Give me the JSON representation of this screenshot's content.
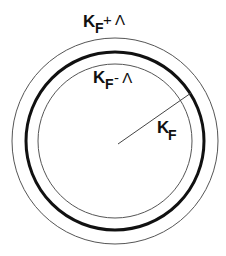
{
  "diagram": {
    "type": "concentric-circles",
    "colors": {
      "stroke": "#1a1a1a",
      "background": "#ffffff"
    },
    "circles": [
      {
        "id": "outer",
        "label_main": "K",
        "label_sub": "F",
        "label_op": "+ Λ",
        "radius_px": 103,
        "stroke_width": 1
      },
      {
        "id": "fermi",
        "label_main": "",
        "label_sub": "",
        "label_op": "",
        "radius_px": 89,
        "stroke_width": 3
      },
      {
        "id": "inner",
        "label_main": "K",
        "label_sub": "F",
        "label_op": "- Λ",
        "radius_px": 77,
        "stroke_width": 1
      }
    ],
    "radius_label": {
      "main": "K",
      "sub": "F"
    }
  }
}
